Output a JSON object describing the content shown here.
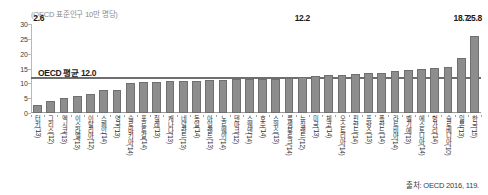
{
  "unit_title": "(OECD 표준인구 10만 명당)",
  "source": "출처: OECD 2016, 119.",
  "average": {
    "label": "OECD 평균 12.0",
    "value": 12.0
  },
  "chart_data": {
    "type": "bar",
    "title": "(OECD 표준인구 10만 명당)",
    "xlabel": "",
    "ylabel": "",
    "ylim": [
      0,
      30
    ],
    "yticks": [
      0,
      5,
      10,
      15,
      20,
      25,
      30
    ],
    "grid": false,
    "legend": "none",
    "average_line": {
      "label": "OECD 평균 12.0",
      "value": 12.0
    },
    "annotations": [
      {
        "category": "터키('13)",
        "text": "2.6"
      },
      {
        "category": "뉴질랜드('12)",
        "text": "12.2"
      },
      {
        "category": "일본('13)",
        "text": "18.7"
      },
      {
        "category": "한국('15)",
        "text": "25.8"
      }
    ],
    "categories": [
      "터키('13)",
      "그리스('12)",
      "멕시코('13)",
      "이스라엘('13)",
      "이탈리아('12)",
      "스페인('14)",
      "영국('13)",
      "슬로바키아('14)",
      "포르투갈('14)",
      "칠레('13)",
      "캐나다('13)",
      "네덜란드('13)",
      "독일('14)",
      "아일랜드('13)",
      "노르웨이('14)",
      "덴마크('12)",
      "스웨덴('14)",
      "호주('14)",
      "스위스('13)",
      "룩셈부르크('14)",
      "뉴질랜드('12)",
      "미국('13)",
      "체코('14)",
      "오스트리아('14)",
      "핀란드('14)",
      "프랑스('13)",
      "폴란드('14)",
      "라트비아('14)",
      "벨기에('13)",
      "에스토니아('14)",
      "헝가리('14)",
      "슬로베니아('10)",
      "일본('13)",
      "한국('15)"
    ],
    "values": [
      2.6,
      4.2,
      5.0,
      5.8,
      6.3,
      7.9,
      7.9,
      10.2,
      10.3,
      10.4,
      10.7,
      10.8,
      10.8,
      11.0,
      11.1,
      11.3,
      11.4,
      11.5,
      11.6,
      11.8,
      12.2,
      12.5,
      12.7,
      12.9,
      13.2,
      13.5,
      13.6,
      14.3,
      14.5,
      15.0,
      15.2,
      15.5,
      18.7,
      25.8
    ]
  }
}
